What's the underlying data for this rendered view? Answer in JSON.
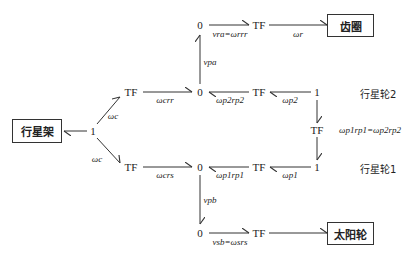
{
  "diagram": {
    "type": "bond-graph",
    "boxes": {
      "carrier": "行星架",
      "ring": "齿圈",
      "sun": "太阳轮"
    },
    "side_labels": {
      "planet2": "行星轮2",
      "planet1": "行星轮1"
    },
    "nodes": {
      "carrier_junction": "1",
      "tf_upper": "TF",
      "tf_lower": "TF",
      "zero_upper": "0",
      "zero_top": "0",
      "zero_lower": "0",
      "zero_bottom": "0",
      "tf_ring": "TF",
      "tf_sun": "TF",
      "tf_p2": "TF",
      "tf_p1": "TF",
      "one_p2": "1",
      "one_p1": "1",
      "tf_planet_mid": "TF"
    },
    "bond_labels": {
      "wc_up": "ωc",
      "wc_down": "ωc",
      "wc_rr": "ωcrr",
      "wc_rs": "ωcrs",
      "vra": "vra=ωrrr",
      "wr": "ωr",
      "vpa": "vpa",
      "wp2rp2": "ωp2rp2",
      "wp2": "ωp2",
      "planet_eq": "ωp1rp1=ωp2rp2",
      "wp1rp1": "ωp1rp1",
      "wp1": "ωp1",
      "vpb": "vpb",
      "vsb": "vsb=ωsrs"
    }
  }
}
